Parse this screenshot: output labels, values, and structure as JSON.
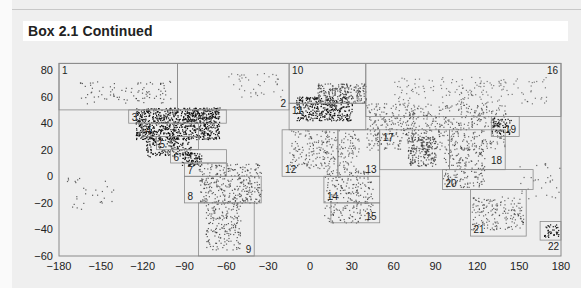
{
  "header": {
    "title": "Box 2.1  Continued"
  },
  "chart_data": {
    "type": "scatter",
    "title": "",
    "xlabel": "",
    "ylabel": "",
    "xlim": [
      -180,
      180
    ],
    "ylim": [
      -60,
      85
    ],
    "x_ticks": [
      -180,
      -150,
      -120,
      -90,
      -60,
      -30,
      0,
      30,
      60,
      90,
      120,
      150,
      180
    ],
    "y_ticks": [
      80,
      60,
      40,
      20,
      0,
      -20,
      -40,
      -60
    ],
    "x_tick_labels": [
      "−180",
      "−150",
      "−120",
      "−90",
      "−60",
      "−30",
      "0",
      "30",
      "60",
      "90",
      "120",
      "150",
      "180"
    ],
    "y_tick_labels": [
      "80",
      "60",
      "40",
      "20",
      "0",
      "−20",
      "−40",
      "−60"
    ],
    "grid": false,
    "regions": [
      {
        "id": "1",
        "lon": [
          -180,
          -95
        ],
        "lat": [
          50,
          85
        ],
        "label_pos": "top-left"
      },
      {
        "id": "2",
        "lon": [
          -95,
          -15
        ],
        "lat": [
          50,
          85
        ],
        "label_pos": "bottom-right"
      },
      {
        "id": "3",
        "lon": [
          -130,
          -60
        ],
        "lat": [
          40,
          50
        ],
        "label_pos": "left"
      },
      {
        "id": "4",
        "lon": [
          -120,
          -80
        ],
        "lat": [
          30,
          40
        ],
        "label_pos": "left"
      },
      {
        "id": "5",
        "lon": [
          -110,
          -80
        ],
        "lat": [
          20,
          30
        ],
        "label_pos": "left"
      },
      {
        "id": "6",
        "lon": [
          -100,
          -60
        ],
        "lat": [
          10,
          20
        ],
        "label_pos": "left"
      },
      {
        "id": "7",
        "lon": [
          -90,
          -60
        ],
        "lat": [
          0,
          10
        ],
        "label_pos": "left"
      },
      {
        "id": "8",
        "lon": [
          -90,
          -35
        ],
        "lat": [
          -20,
          0
        ],
        "label_pos": "bottom-left"
      },
      {
        "id": "9",
        "lon": [
          -80,
          -40
        ],
        "lat": [
          -60,
          -20
        ],
        "label_pos": "bottom-right"
      },
      {
        "id": "10",
        "lon": [
          -15,
          40
        ],
        "lat": [
          55,
          85
        ],
        "label_pos": "top-left"
      },
      {
        "id": "11",
        "lon": [
          -15,
          40
        ],
        "lat": [
          35,
          55
        ],
        "label_pos": "top-left"
      },
      {
        "id": "12",
        "lon": [
          -20,
          20
        ],
        "lat": [
          0,
          35
        ],
        "label_pos": "bottom-left"
      },
      {
        "id": "13",
        "lon": [
          20,
          50
        ],
        "lat": [
          0,
          35
        ],
        "label_pos": "bottom-right"
      },
      {
        "id": "14",
        "lon": [
          10,
          50
        ],
        "lat": [
          -20,
          0
        ],
        "label_pos": "bottom-left"
      },
      {
        "id": "15",
        "lon": [
          15,
          50
        ],
        "lat": [
          -35,
          -20
        ],
        "label_pos": "bottom-right"
      },
      {
        "id": "16",
        "lon": [
          40,
          180
        ],
        "lat": [
          45,
          85
        ],
        "label_pos": "top-right"
      },
      {
        "id": "17",
        "lon": [
          50,
          100
        ],
        "lat": [
          5,
          35
        ],
        "label_pos": "top-left"
      },
      {
        "id": "18",
        "lon": [
          100,
          140
        ],
        "lat": [
          5,
          35
        ],
        "label_pos": "right"
      },
      {
        "id": "19",
        "lon": [
          130,
          150
        ],
        "lat": [
          30,
          45
        ],
        "label_pos": "bottom-right"
      },
      {
        "id": "20",
        "lon": [
          95,
          160
        ],
        "lat": [
          -10,
          5
        ],
        "label_pos": "bottom-left"
      },
      {
        "id": "21",
        "lon": [
          115,
          155
        ],
        "lat": [
          -45,
          -10
        ],
        "label_pos": "bottom-left"
      },
      {
        "id": "22",
        "lon": [
          165,
          180
        ],
        "lat": [
          -48,
          -34
        ],
        "label_pos": "below"
      }
    ]
  }
}
